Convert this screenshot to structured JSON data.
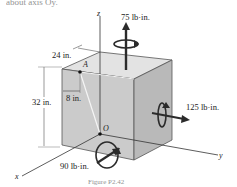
{
  "figure": {
    "top_text": "about axis Oy.",
    "caption": "Figure P2.42"
  },
  "axes": {
    "x": "x",
    "y": "y",
    "z": "z"
  },
  "points": {
    "A": "A",
    "O": "O"
  },
  "dimensions": {
    "width": "24 in.",
    "height": "32 in.",
    "offset": "8 in."
  },
  "moments": {
    "top": "75 lb·in.",
    "right": "125 lb·in.",
    "bottom": "90 lb·in."
  },
  "colors": {
    "front_face": "#c9c9c9",
    "top_face": "#e2e2e2",
    "right_face": "#b8b8b8",
    "arrow": "#2b2b2b"
  }
}
